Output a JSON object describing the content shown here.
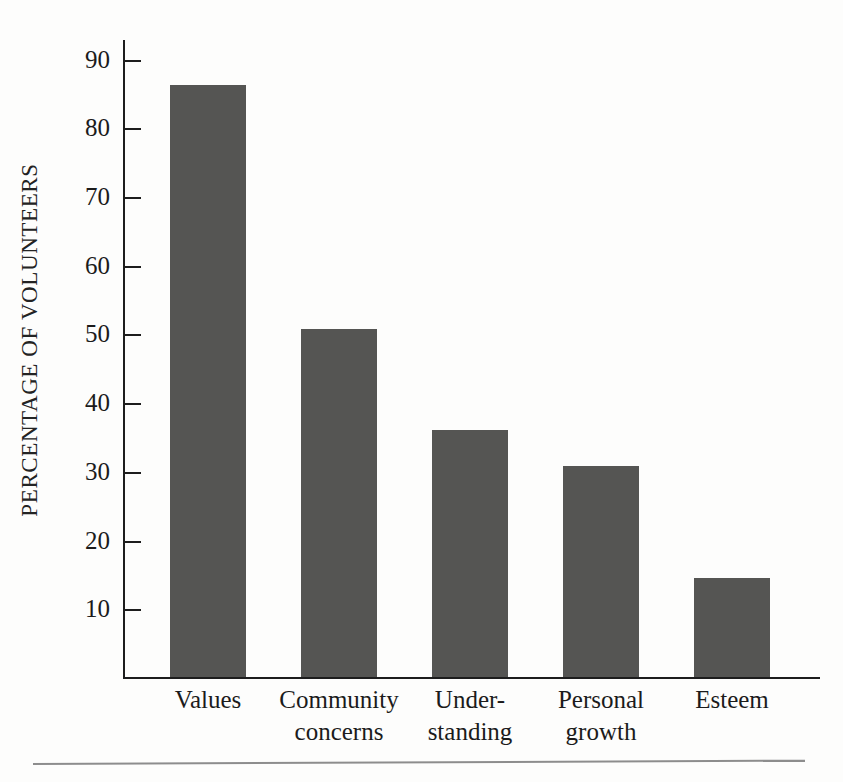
{
  "chart_data": {
    "type": "bar",
    "title": "",
    "subtitle": "",
    "xlabel": "",
    "ylabel": "PERCENTAGE OF VOLUNTEERS",
    "categories": [
      "Values",
      "Community concerns",
      "Under-standing",
      "Personal growth",
      "Esteem"
    ],
    "category_lines": [
      [
        "Values"
      ],
      [
        "Community",
        "concerns"
      ],
      [
        "Under-",
        "standing"
      ],
      [
        "Personal",
        "growth"
      ],
      [
        "Esteem"
      ]
    ],
    "values": [
      86.5,
      51,
      36.3,
      31,
      14.7
    ],
    "ylim": [
      0,
      93
    ],
    "yticks": [
      90,
      80,
      70,
      60,
      50,
      40,
      30,
      20,
      10
    ],
    "ytick_labels": [
      "90",
      "80",
      "70",
      "60",
      "50",
      "40",
      "30",
      "20",
      "10"
    ],
    "grid": false,
    "legend": null,
    "legend_position": "none",
    "bar_color": "#555553",
    "axis_color": "#1d1d1d",
    "text_color": "#1b1b1b",
    "background_color": "#fdfdfc",
    "annotations": []
  },
  "figure": {
    "bottom_rule_color": "#8d8d8d"
  }
}
